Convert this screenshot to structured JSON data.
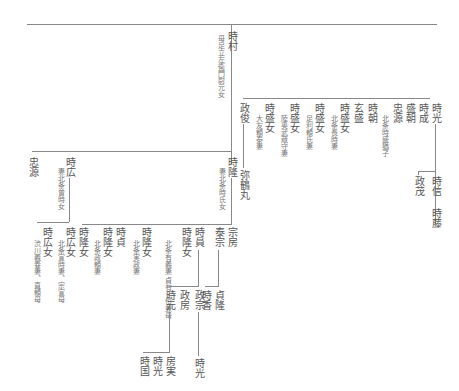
{
  "root": {
    "name": "時村",
    "note": "母足立左衛門尉元女"
  },
  "top_branch": [
    {
      "name": "政俊",
      "child": "弥鶴丸"
    },
    {
      "name": "時盛女",
      "note": "大友頼泰妻"
    },
    {
      "name": "時盛女",
      "note": "陸奥武蔵守妻"
    },
    {
      "name": "時盛女",
      "note": "足利頼氏妻"
    },
    {
      "name": "時盛女",
      "note": "北条長時妻"
    },
    {
      "name": "玄盛"
    },
    {
      "name": "時朝"
    },
    {
      "name": "北条時盛猶子",
      "is_note": true
    },
    {
      "name": "忠源"
    },
    {
      "name": "盛朝"
    },
    {
      "name": "時成"
    },
    {
      "name": "時光",
      "children": [
        "政茂",
        "時信"
      ],
      "grandchild": "時藤"
    }
  ],
  "mid_branch": [
    {
      "name": "忠源"
    },
    {
      "name": "時広",
      "note": "妻北条曾時女"
    },
    {
      "name": "時隆",
      "note": "妻北条時氏女"
    }
  ],
  "jiryu_children": [
    {
      "name": "時広女",
      "note": "渋川義春妻、直頼母"
    },
    {
      "name": "時広女",
      "note": "北条宣時妻、宗宣母"
    },
    {
      "name": "時隆女"
    },
    {
      "name": "時隆女",
      "note": "北条政頼妻"
    },
    {
      "name": "時貞"
    },
    {
      "name": "時隆女",
      "note": "北条実政妻"
    },
    {
      "name": "時隆女",
      "note": "北条有義妻 貞有・恒兼母"
    },
    {
      "name": "時員",
      "children": [
        "時元",
        "政房",
        "政宗"
      ]
    },
    {
      "name": "泰宗",
      "children": [
        "時香",
        "貞隆"
      ]
    },
    {
      "name": "宗房"
    }
  ],
  "tokimoto_children": [
    "時国",
    "時光",
    "房実"
  ],
  "masamune_child": "時光"
}
